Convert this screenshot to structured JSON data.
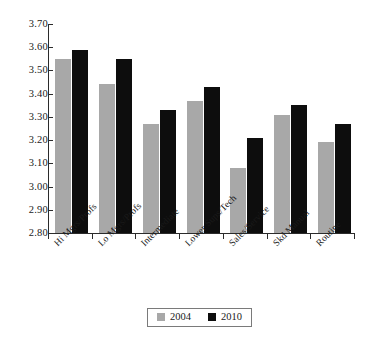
{
  "chart_data": {
    "type": "bar",
    "title": "",
    "subtitle": "",
    "xlabel": "",
    "ylabel": "",
    "ylim": [
      2.8,
      3.7
    ],
    "ytick_step": 0.1,
    "ytick_labels": [
      "3.70",
      "3.60",
      "3.50",
      "3.40",
      "3.30",
      "3.20",
      "3.10",
      "3.00",
      "2.90",
      "2.80"
    ],
    "ytick_values": [
      3.7,
      3.6,
      3.5,
      3.4,
      3.3,
      3.2,
      3.1,
      3.0,
      2.9,
      2.8
    ],
    "grid": false,
    "legend_position": "bottom-center",
    "categories": [
      "Hi Mgrs/Profs",
      "Lo Mgrs/Profs",
      "Intermediate",
      "Lower Sups/Tech",
      "Sales/Service",
      "Skd Manual",
      "Routine"
    ],
    "series": [
      {
        "name": "2004",
        "color": "#a8a8a8",
        "values": [
          3.55,
          3.44,
          3.27,
          3.37,
          3.08,
          3.31,
          3.19
        ]
      },
      {
        "name": "2010",
        "color": "#0d0d0d",
        "values": [
          3.59,
          3.55,
          3.33,
          3.43,
          3.21,
          3.35,
          3.27
        ]
      }
    ]
  },
  "legend": {
    "items": [
      {
        "label": "2004",
        "swatch": "legend-swatch-2004"
      },
      {
        "label": "2010",
        "swatch": "legend-swatch-2010"
      }
    ]
  },
  "colors": {
    "series_2004": "#a8a8a8",
    "series_2010": "#0d0d0d",
    "axis": "#2b2b2b",
    "text": "#1a1a1a",
    "background": "#ffffff",
    "legend_border": "#7a7a7a"
  }
}
